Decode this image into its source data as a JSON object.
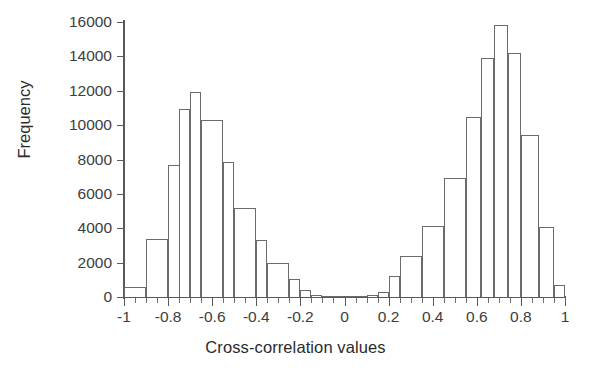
{
  "chart_data": {
    "type": "bar",
    "subtype": "histogram",
    "title": "",
    "xlabel": "Cross-correlation values",
    "ylabel": "Frequency",
    "xlim": [
      -1,
      1
    ],
    "ylim": [
      0,
      16000
    ],
    "ytick_step": 2000,
    "bin_width": 0.1,
    "grid": false,
    "legend": null,
    "xtick_labels": [
      "-1",
      "-0.8",
      "-0.6",
      "-0.4",
      "-0.2",
      "0",
      "0.2",
      "0.4",
      "0.6",
      "0.8",
      "1"
    ],
    "xtick_values": [
      -1,
      -0.8,
      -0.6,
      -0.4,
      -0.2,
      0,
      0.2,
      0.4,
      0.6,
      0.8,
      1
    ],
    "xtick_minor_step": 0.05,
    "ytick_labels": [
      "0",
      "2000",
      "4000",
      "6000",
      "8000",
      "10000",
      "12000",
      "14000",
      "16000"
    ],
    "ytick_values": [
      0,
      2000,
      4000,
      6000,
      8000,
      10000,
      12000,
      14000,
      16000
    ],
    "bin_edges": [
      -1.0,
      -0.9,
      -0.8,
      -0.7,
      -0.6,
      -0.5,
      -0.4,
      -0.3,
      -0.2,
      -0.1,
      0.0,
      0.1,
      0.2,
      0.3,
      0.4,
      0.5,
      0.6,
      0.7,
      0.8,
      0.9,
      1.0
    ],
    "bin_centers": [
      -0.95,
      -0.85,
      -0.75,
      -0.65,
      -0.55,
      -0.45,
      -0.35,
      -0.25,
      -0.15,
      -0.05,
      0.05,
      0.15,
      0.25,
      0.35,
      0.45,
      0.55,
      0.65,
      0.75,
      0.85,
      0.95
    ],
    "values": [
      600,
      3400,
      7700,
      10950,
      11900,
      10300,
      7850,
      5200,
      3300,
      1950,
      1050,
      400,
      120,
      60,
      40,
      60,
      120,
      300,
      1200,
      2400,
      4150,
      6900,
      10500,
      13900,
      15800,
      14200,
      9450,
      4100,
      700
    ],
    "bars": [
      {
        "center": -0.95,
        "x0": -1.0,
        "x1": -0.9,
        "value": 600
      },
      {
        "center": -0.85,
        "x0": -0.9,
        "x1": -0.8,
        "value": 3400
      },
      {
        "center": -0.75,
        "x0": -0.8,
        "x1": -0.7,
        "value": 7700
      },
      {
        "center": -0.7,
        "x0": -0.75,
        "x1": -0.7,
        "value": 10950
      },
      {
        "center": -0.68,
        "x0": -0.7,
        "x1": -0.65,
        "value": 11900
      },
      {
        "center": -0.6,
        "x0": -0.65,
        "x1": -0.55,
        "value": 10300
      },
      {
        "center": -0.52,
        "x0": -0.55,
        "x1": -0.5,
        "value": 7850
      },
      {
        "center": -0.45,
        "x0": -0.5,
        "x1": -0.4,
        "value": 5200
      },
      {
        "center": -0.37,
        "x0": -0.4,
        "x1": -0.35,
        "value": 3300
      },
      {
        "center": -0.3,
        "x0": -0.35,
        "x1": -0.25,
        "value": 1950
      },
      {
        "center": -0.22,
        "x0": -0.25,
        "x1": -0.2,
        "value": 1050
      },
      {
        "center": -0.17,
        "x0": -0.2,
        "x1": -0.15,
        "value": 400
      },
      {
        "center": -0.12,
        "x0": -0.15,
        "x1": -0.1,
        "value": 120
      },
      {
        "center": -0.07,
        "x0": -0.1,
        "x1": -0.05,
        "value": 60
      },
      {
        "center": -0.02,
        "x0": -0.05,
        "x1": 0.0,
        "value": 40
      },
      {
        "center": 0.02,
        "x0": 0.0,
        "x1": 0.05,
        "value": 40
      },
      {
        "center": 0.07,
        "x0": 0.05,
        "x1": 0.1,
        "value": 60
      },
      {
        "center": 0.12,
        "x0": 0.1,
        "x1": 0.15,
        "value": 120
      },
      {
        "center": 0.17,
        "x0": 0.15,
        "x1": 0.2,
        "value": 300
      },
      {
        "center": 0.22,
        "x0": 0.2,
        "x1": 0.25,
        "value": 1200
      },
      {
        "center": 0.3,
        "x0": 0.25,
        "x1": 0.35,
        "value": 2400
      },
      {
        "center": 0.4,
        "x0": 0.35,
        "x1": 0.45,
        "value": 4150
      },
      {
        "center": 0.5,
        "x0": 0.45,
        "x1": 0.55,
        "value": 6900
      },
      {
        "center": 0.58,
        "x0": 0.55,
        "x1": 0.62,
        "value": 10500
      },
      {
        "center": 0.65,
        "x0": 0.62,
        "x1": 0.68,
        "value": 13900
      },
      {
        "center": 0.71,
        "x0": 0.68,
        "x1": 0.74,
        "value": 15800
      },
      {
        "center": 0.77,
        "x0": 0.74,
        "x1": 0.8,
        "value": 14200
      },
      {
        "center": 0.84,
        "x0": 0.8,
        "x1": 0.88,
        "value": 9450
      },
      {
        "center": 0.91,
        "x0": 0.88,
        "x1": 0.95,
        "value": 4100
      },
      {
        "center": 0.97,
        "x0": 0.95,
        "x1": 1.0,
        "value": 700
      }
    ],
    "colors": {
      "bar_fill": "#ffffff",
      "bar_edge": "#6b6b6b",
      "axis": "#595959",
      "text": "#2b2b2b",
      "background": "#ffffff"
    }
  }
}
